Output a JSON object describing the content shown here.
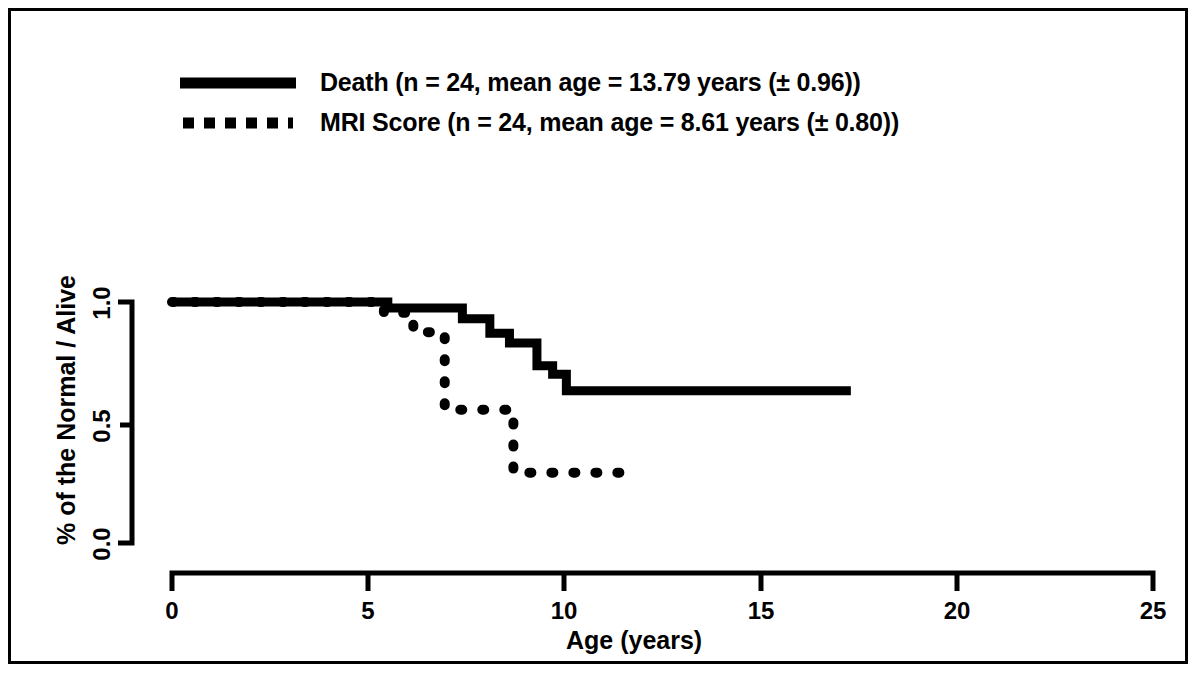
{
  "figure": {
    "background_color": "#ffffff",
    "ink_color": "#000000",
    "border": true
  },
  "legend": {
    "position": "top-left",
    "entries": [
      {
        "key": "death",
        "style": "solid",
        "label": "Death (n = 24, mean age = 13.79 years (± 0.96))"
      },
      {
        "key": "mri_score",
        "style": "dotted",
        "label": "MRI Score (n = 24, mean age = 8.61 years (± 0.80))"
      }
    ]
  },
  "axes": {
    "x_title": "Age (years)",
    "y_title": "% of the Normal / Alive",
    "x_ticks": [
      "0",
      "5",
      "10",
      "15",
      "20",
      "25"
    ],
    "y_ticks": [
      "0.0",
      "0.5",
      "1.0"
    ]
  },
  "chart_data": {
    "type": "line",
    "subtype": "kaplan-meier-step",
    "title": "",
    "xlabel": "Age (years)",
    "ylabel": "% of the Normal / Alive",
    "xlim": [
      0,
      25
    ],
    "ylim": [
      0.0,
      1.0
    ],
    "xticks": [
      0,
      5,
      10,
      15,
      20,
      25
    ],
    "yticks": [
      0.0,
      0.5,
      1.0
    ],
    "grid": false,
    "legend_position": "top-left",
    "series": [
      {
        "name": "Death (n = 24, mean age = 13.79 years (± 0.96))",
        "short_name": "Death",
        "style": "solid",
        "n": 24,
        "mean_age": 13.79,
        "mean_age_se": 0.96,
        "x": [
          0.0,
          5.5,
          5.5,
          7.4,
          7.4,
          8.1,
          8.1,
          8.6,
          8.6,
          9.3,
          9.3,
          9.7,
          9.7,
          10.05,
          10.05,
          17.3
        ],
        "y": [
          1.0,
          1.0,
          0.975,
          0.975,
          0.93,
          0.93,
          0.87,
          0.87,
          0.83,
          0.83,
          0.735,
          0.735,
          0.7,
          0.7,
          0.632,
          0.632
        ],
        "steps": [
          {
            "age": 5.5,
            "survival": 0.975
          },
          {
            "age": 7.4,
            "survival": 0.93
          },
          {
            "age": 8.1,
            "survival": 0.87
          },
          {
            "age": 8.6,
            "survival": 0.83
          },
          {
            "age": 9.3,
            "survival": 0.735
          },
          {
            "age": 9.7,
            "survival": 0.7
          },
          {
            "age": 10.05,
            "survival": 0.632
          }
        ],
        "final_survival": 0.632,
        "x_end": 17.3
      },
      {
        "name": "MRI Score (n = 24, mean age = 8.61 years (± 0.80))",
        "short_name": "MRI Score",
        "style": "dotted",
        "n": 24,
        "mean_age": 8.61,
        "mean_age_se": 0.8,
        "x": [
          0.0,
          5.4,
          5.4,
          6.15,
          6.15,
          6.95,
          6.95,
          8.7,
          8.7,
          11.8
        ],
        "y": [
          1.0,
          1.0,
          0.955,
          0.955,
          0.875,
          0.875,
          0.553,
          0.553,
          0.292,
          0.292
        ],
        "steps": [
          {
            "age": 5.4,
            "survival": 0.955
          },
          {
            "age": 6.15,
            "survival": 0.875
          },
          {
            "age": 6.95,
            "survival": 0.553
          },
          {
            "age": 8.7,
            "survival": 0.292
          }
        ],
        "final_survival": 0.292,
        "x_end": 11.8
      }
    ]
  }
}
